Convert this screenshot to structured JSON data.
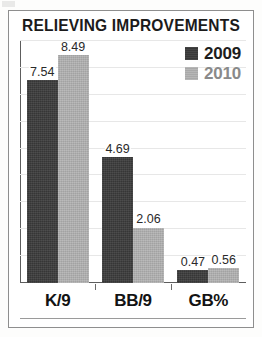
{
  "chart_data": {
    "type": "bar",
    "title": "RELIEVING IMPROVEMENTS",
    "xlabel": "",
    "ylabel": "",
    "categories": [
      "K/9",
      "BB/9",
      "GB%"
    ],
    "series": [
      {
        "name": "2009",
        "color": "#3b3b3b",
        "values": [
          7.54,
          4.69,
          0.47
        ]
      },
      {
        "name": "2010",
        "color": "#b2b2b2",
        "values": [
          8.49,
          2.06,
          0.56
        ]
      }
    ],
    "value_labels": [
      [
        "7.54",
        "8.49"
      ],
      [
        "4.69",
        "2.06"
      ],
      [
        "0.47",
        "0.56"
      ]
    ],
    "ylim": [
      0,
      9.0
    ],
    "gridlines": [
      1.0,
      2.0,
      3.0,
      4.0,
      5.0,
      6.0,
      7.0,
      8.0,
      9.0
    ],
    "grid": true,
    "legend_position": "top-right"
  },
  "legend": {
    "items": [
      {
        "label": "2009",
        "swatch": "legend-swatch-2009"
      },
      {
        "label": "2010",
        "swatch": "legend-swatch-2010"
      }
    ]
  },
  "colors": {
    "series_2009": "#3b3b3b",
    "series_2010": "#b2b2b2",
    "frame": "#8e8e8e",
    "axis": "#5d5d5d",
    "gridline": "#e7e7e7",
    "title_text": "#1b1b1b",
    "value_text": "#2a2a2a",
    "background": "#ffffff"
  }
}
